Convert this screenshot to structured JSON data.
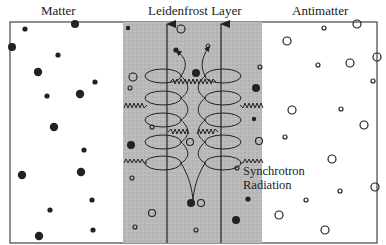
{
  "titles": {
    "left": "Matter",
    "center": "Leidenfrost Layer",
    "right": "Antimatter"
  },
  "annotation": {
    "line1": "Synchrotron",
    "line2": "Radiation"
  },
  "colors": {
    "band": "#b8b8b8",
    "ink": "#222222",
    "border": "#444444"
  },
  "regions": [
    {
      "name": "matter",
      "particles": "filled dots (matter particles)"
    },
    {
      "name": "leidenfrost-layer",
      "particles": "mixed filled and open dots, magnetic field lines with helical orbits"
    },
    {
      "name": "antimatter",
      "particles": "open circles (antimatter particles)"
    }
  ]
}
